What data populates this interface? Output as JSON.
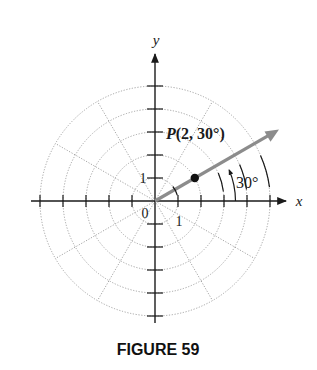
{
  "figure": {
    "caption": "FIGURE 59",
    "type": "polar coordinate diagram"
  },
  "axes": {
    "x_label": "x",
    "y_label": "y",
    "origin_label": "0",
    "x_unit_label": "1",
    "y_unit_label": "1",
    "tick_range": [
      -5,
      5
    ]
  },
  "polar_grid": {
    "circle_radii": [
      1,
      2,
      3,
      4,
      5
    ],
    "radial_line_angles_deg": [
      30,
      60,
      120,
      150,
      210,
      240,
      300,
      330
    ],
    "style": "dotted gray"
  },
  "point": {
    "label": "P(2, 30°)",
    "r": 2,
    "theta_deg": 30
  },
  "ray": {
    "angle_deg": 30,
    "color": "#8c8c8c"
  },
  "angle_marker": {
    "label": "30°",
    "radius": 3.5
  },
  "colors": {
    "axis": "#1a1a1a",
    "grid": "#9a9a9a",
    "ray": "#8c8c8c",
    "point": "#111111"
  }
}
